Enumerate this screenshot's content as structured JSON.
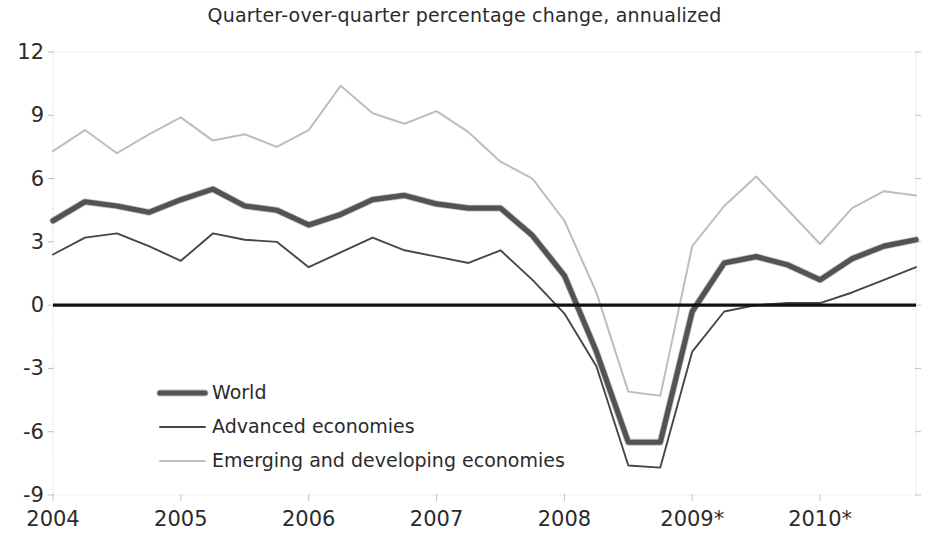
{
  "chart_data": {
    "type": "line",
    "title": "Quarter-over-quarter percentage change, annualized",
    "xlabel": "",
    "ylabel": "",
    "ylim": [
      -9,
      12
    ],
    "xlim": [
      2004.0,
      2010.75
    ],
    "yticks": [
      "12",
      "9",
      "6",
      "3",
      "0",
      "-3",
      "-6",
      "-9"
    ],
    "ytick_values": [
      12,
      9,
      6,
      3,
      0,
      -3,
      -6,
      -9
    ],
    "xticks": [
      "2004",
      "2005",
      "2006",
      "2007",
      "2008",
      "2009*",
      "2010*"
    ],
    "xtick_values": [
      2004,
      2005,
      2006,
      2007,
      2008,
      2009,
      2010
    ],
    "grid": false,
    "legend_position": "center-left-lower",
    "zero_line": true,
    "x": [
      2004.0,
      2004.25,
      2004.5,
      2004.75,
      2005.0,
      2005.25,
      2005.5,
      2005.75,
      2006.0,
      2006.25,
      2006.5,
      2006.75,
      2007.0,
      2007.25,
      2007.5,
      2007.75,
      2008.0,
      2008.25,
      2008.5,
      2008.75,
      2009.0,
      2009.25,
      2009.5,
      2009.75,
      2010.0,
      2010.25,
      2010.5,
      2010.75
    ],
    "series": [
      {
        "name": "World",
        "style": "thick-dark",
        "color": "#4a4a4a",
        "values": [
          4.0,
          4.9,
          4.7,
          4.4,
          5.0,
          5.5,
          4.7,
          4.5,
          3.8,
          4.3,
          5.0,
          5.2,
          4.8,
          4.6,
          4.6,
          3.3,
          1.4,
          -2.2,
          -6.5,
          -6.5,
          -0.3,
          2.0,
          2.3,
          1.9,
          1.2,
          2.2,
          2.8,
          3.1
        ]
      },
      {
        "name": "Advanced economies",
        "style": "thin-dark",
        "color": "#3c3c3c",
        "values": [
          2.4,
          3.2,
          3.4,
          2.8,
          2.1,
          3.4,
          3.1,
          3.0,
          1.8,
          2.5,
          3.2,
          2.6,
          2.3,
          2.0,
          2.6,
          1.2,
          -0.4,
          -2.9,
          -7.6,
          -7.7,
          -2.2,
          -0.3,
          0.0,
          0.1,
          0.1,
          0.6,
          1.2,
          1.8
        ]
      },
      {
        "name": "Emerging and developing economies",
        "style": "light-gray",
        "color": "#bdbdbd",
        "values": [
          7.3,
          8.3,
          7.2,
          8.1,
          8.9,
          7.8,
          8.1,
          7.5,
          8.3,
          10.4,
          9.1,
          8.6,
          9.2,
          8.2,
          6.8,
          6.0,
          4.0,
          0.6,
          -4.1,
          -4.3,
          2.8,
          4.7,
          6.1,
          4.5,
          2.9,
          4.6,
          5.4,
          5.2
        ]
      }
    ]
  },
  "legend": {
    "entries": [
      {
        "label": "World"
      },
      {
        "label": "Advanced economies"
      },
      {
        "label": "Emerging and developing economies"
      }
    ]
  },
  "footnote": {
    "text": ""
  }
}
